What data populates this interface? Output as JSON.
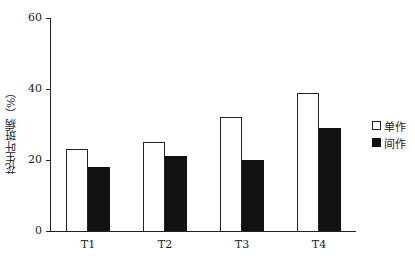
{
  "chart_data": {
    "type": "bar",
    "title": "",
    "xlabel": "",
    "ylabel": "花生叶斑病（%）",
    "ylim": [
      0,
      60
    ],
    "yticks": [
      0,
      20,
      40,
      60
    ],
    "grid": false,
    "legend_position": "right",
    "categories": [
      "T1",
      "T2",
      "T3",
      "T4"
    ],
    "series": [
      {
        "name": "单作",
        "style": "open",
        "values": [
          23,
          25,
          32,
          39
        ]
      },
      {
        "name": "间作",
        "style": "solid",
        "values": [
          18,
          21,
          20,
          29
        ]
      }
    ]
  },
  "axis": {
    "y_title": "花生叶斑病（%）",
    "y_ticks": [
      "0",
      "20",
      "40",
      "60"
    ],
    "x_ticks": [
      "T1",
      "T2",
      "T3",
      "T4"
    ]
  },
  "legend": {
    "items": [
      {
        "label": "单作",
        "icon": "open-square-icon"
      },
      {
        "label": "间作",
        "icon": "filled-square-icon"
      }
    ]
  },
  "colors": {
    "solid_bar": "#111111",
    "open_bar_fill": "#ffffff",
    "axis": "#222222"
  }
}
